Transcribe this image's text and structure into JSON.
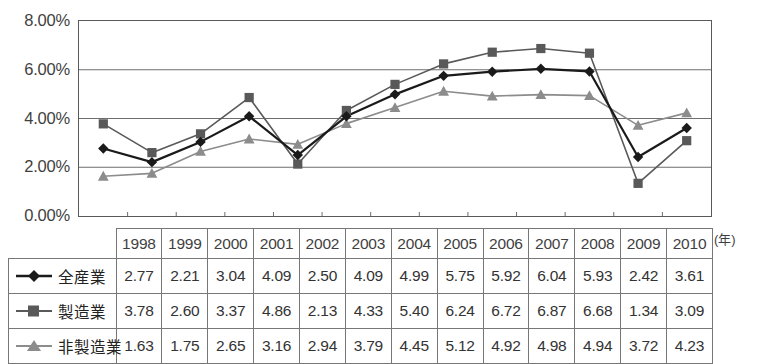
{
  "chart_data": {
    "type": "line",
    "title": "",
    "subtitle": "",
    "xlabel": "(年)",
    "ylabel": "",
    "categories": [
      "1998",
      "1999",
      "2000",
      "2001",
      "2002",
      "2003",
      "2004",
      "2005",
      "2006",
      "2007",
      "2008",
      "2009",
      "2010"
    ],
    "ylim": [
      0,
      8
    ],
    "ytick_values": [
      0,
      2,
      4,
      6,
      8
    ],
    "ytick_labels": [
      "0.00%",
      "2.00%",
      "4.00%",
      "6.00%",
      "8.00%"
    ],
    "grid": true,
    "legend_position": "table-row-labels",
    "series": [
      {
        "name": "全産業",
        "marker": "diamond",
        "color": "#1a1a1a",
        "values": [
          2.77,
          2.21,
          3.04,
          4.09,
          2.5,
          4.09,
          4.99,
          5.75,
          5.92,
          6.04,
          5.93,
          2.42,
          3.61
        ]
      },
      {
        "name": "製造業",
        "marker": "square",
        "color": "#595959",
        "values": [
          3.78,
          2.6,
          3.37,
          4.86,
          2.13,
          4.33,
          5.4,
          6.24,
          6.72,
          6.87,
          6.68,
          1.34,
          3.09
        ]
      },
      {
        "name": "非製造業",
        "marker": "triangle",
        "color": "#8c8c8c",
        "values": [
          1.63,
          1.75,
          2.65,
          3.16,
          2.94,
          3.79,
          4.45,
          5.12,
          4.92,
          4.98,
          4.94,
          3.72,
          4.23
        ]
      }
    ]
  },
  "axis": {
    "unit_label": "(年)"
  },
  "table": {
    "year_header": [
      "1998",
      "1999",
      "2000",
      "2001",
      "2002",
      "2003",
      "2004",
      "2005",
      "2006",
      "2007",
      "2008",
      "2009",
      "2010"
    ],
    "rows": [
      {
        "label": "全産業",
        "values": [
          "2.77",
          "2.21",
          "3.04",
          "4.09",
          "2.50",
          "4.09",
          "4.99",
          "5.75",
          "5.92",
          "6.04",
          "5.93",
          "2.42",
          "3.61"
        ]
      },
      {
        "label": "製造業",
        "values": [
          "3.78",
          "2.60",
          "3.37",
          "4.86",
          "2.13",
          "4.33",
          "5.40",
          "6.24",
          "6.72",
          "6.87",
          "6.68",
          "1.34",
          "3.09"
        ]
      },
      {
        "label": "非製造業",
        "values": [
          "1.63",
          "1.75",
          "2.65",
          "3.16",
          "2.94",
          "3.79",
          "4.45",
          "5.12",
          "4.92",
          "4.98",
          "4.94",
          "3.72",
          "4.23"
        ]
      }
    ]
  },
  "colors": {
    "series_all": "#1a1a1a",
    "series_manufacturing": "#595959",
    "series_nonmanufacturing": "#8c8c8c",
    "grid": "#6e6e6e",
    "border": "#777777"
  }
}
